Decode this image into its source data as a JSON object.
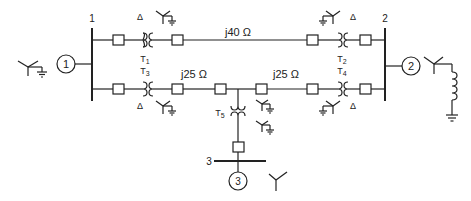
{
  "diagram": {
    "type": "power-system-one-line",
    "buses": [
      {
        "id": "bus1",
        "label": "1"
      },
      {
        "id": "bus2",
        "label": "2"
      },
      {
        "id": "bus3",
        "label": "3"
      }
    ],
    "generators": [
      {
        "id": "gen1",
        "label": "1",
        "connection": "wye-grounded"
      },
      {
        "id": "gen2",
        "label": "2",
        "connection": "wye-grounded-through-reactor"
      },
      {
        "id": "gen3",
        "label": "3",
        "connection": "wye-ungrounded"
      }
    ],
    "transformers": [
      {
        "id": "T1",
        "label": "T",
        "sub": "1",
        "primary": "Δ",
        "secondary": "Y-grounded"
      },
      {
        "id": "T2",
        "label": "T",
        "sub": "2",
        "primary": "Y-grounded",
        "secondary": "Δ"
      },
      {
        "id": "T3",
        "label": "T",
        "sub": "3",
        "primary": "Δ",
        "secondary": "Y-grounded"
      },
      {
        "id": "T4",
        "label": "T",
        "sub": "4",
        "primary": "Y-grounded",
        "secondary": "Δ"
      },
      {
        "id": "T5",
        "label": "T",
        "sub": "5",
        "primary": "Y-grounded",
        "secondary": "Y-grounded"
      }
    ],
    "lines": [
      {
        "id": "line12",
        "impedance": "j40 Ω"
      },
      {
        "id": "line-lower-left",
        "impedance": "j25 Ω"
      },
      {
        "id": "line-lower-right",
        "impedance": "j25 Ω"
      }
    ],
    "symbols": {
      "delta": "Δ",
      "j40": "j40 Ω",
      "j25a": "j25 Ω",
      "j25b": "j25 Ω"
    }
  }
}
